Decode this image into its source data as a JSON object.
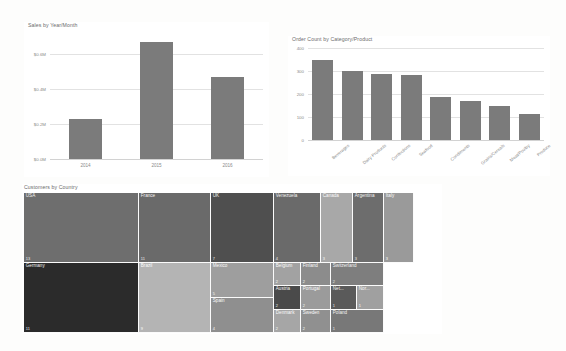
{
  "page": {
    "background": "#fdfdfc",
    "bar_color": "#7b7b7b",
    "grid_color": "#e2e2e2",
    "axis_text_color": "#8a8a8a",
    "title_color": "#6b6b6b"
  },
  "chart_data": [
    {
      "type": "bar",
      "title": "Sales by Year/Month",
      "categories": [
        "2014",
        "2015",
        "2016"
      ],
      "values": [
        225000,
        665000,
        465000
      ],
      "ytick_labels": [
        "$0.0M",
        "$0.2M",
        "$0.4M",
        "$0.6M"
      ],
      "ytick_values": [
        0,
        200000,
        400000,
        600000
      ],
      "ylim": [
        0,
        700000
      ],
      "xlabel": "",
      "ylabel": "",
      "grid": true,
      "legend": "none"
    },
    {
      "type": "bar",
      "title": "Order Count by Category/Product",
      "categories": [
        "Beverages",
        "Dairy Products",
        "Confections",
        "Seafood",
        "Condiments",
        "Grains/Cereals",
        "Meat/Poultry",
        "Produce"
      ],
      "values": [
        350,
        300,
        288,
        284,
        186,
        171,
        150,
        112
      ],
      "ytick_labels": [
        "0",
        "100",
        "200",
        "300",
        "400"
      ],
      "ytick_values": [
        0,
        100,
        200,
        300,
        400
      ],
      "ylim": [
        0,
        400
      ],
      "xlabel": "",
      "ylabel": "",
      "grid": true,
      "legend": "none"
    },
    {
      "type": "treemap",
      "title": "Customers by Country",
      "value_label": "Customers",
      "cells": [
        {
          "label": "USA",
          "value": "13",
          "color": "#6e6e6e",
          "shade": "dark"
        },
        {
          "label": "France",
          "value": "11",
          "color": "#6a6a6a",
          "shade": "dark"
        },
        {
          "label": "UK",
          "value": "7",
          "color": "#4f4f4f",
          "shade": "dark"
        },
        {
          "label": "Venezuela",
          "value": "4",
          "color": "#6a6a6a",
          "shade": "dark"
        },
        {
          "label": "Canada",
          "value": "3",
          "color": "#a8a8a8",
          "shade": "light"
        },
        {
          "label": "Argentina",
          "value": "3",
          "color": "#6d6d6d",
          "shade": "dark"
        },
        {
          "label": "Italy",
          "value": "3",
          "color": "#9a9a9a",
          "shade": "light"
        },
        {
          "label": "Germany",
          "value": "11",
          "color": "#2b2b2b",
          "shade": "dark"
        },
        {
          "label": "Brazil",
          "value": "9",
          "color": "#b4b4b4",
          "shade": "light"
        },
        {
          "label": "Mexico",
          "value": "5",
          "color": "#9e9e9e",
          "shade": "light"
        },
        {
          "label": "Spain",
          "value": "4",
          "color": "#8f8f8f",
          "shade": "light"
        },
        {
          "label": "Belgium",
          "value": "2",
          "color": "#a2a2a2",
          "shade": "light"
        },
        {
          "label": "Finland",
          "value": "2",
          "color": "#8c8c8c",
          "shade": "light"
        },
        {
          "label": "Switzerland",
          "value": "2",
          "color": "#7e7e7e",
          "shade": "dark"
        },
        {
          "label": "Austria",
          "value": "2",
          "color": "#4a4a4a",
          "shade": "dark"
        },
        {
          "label": "Portugal",
          "value": "2",
          "color": "#9b9b9b",
          "shade": "light"
        },
        {
          "label": "Net...",
          "value": "1",
          "color": "#5a5a5a",
          "shade": "dark"
        },
        {
          "label": "Nor...",
          "value": "1",
          "color": "#a0a0a0",
          "shade": "light"
        },
        {
          "label": "Denmark",
          "value": "2",
          "color": "#a6a6a6",
          "shade": "light"
        },
        {
          "label": "Sweden",
          "value": "2",
          "color": "#909090",
          "shade": "light"
        },
        {
          "label": "Poland",
          "value": "1",
          "color": "#787878",
          "shade": "dark"
        }
      ]
    }
  ]
}
